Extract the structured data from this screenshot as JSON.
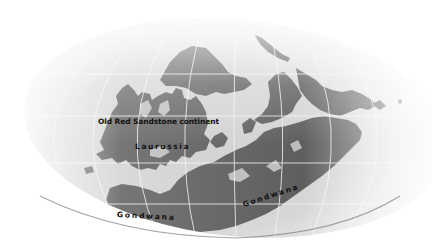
{
  "map": {
    "type": "paleogeographic world map",
    "projection": "elliptical (Mollweide-style), faded globe",
    "colors": {
      "background": "#ffffff",
      "ocean": "#d9d9d9",
      "land": "#5f5f5f",
      "graticule": "#f2f2f2",
      "label_text": "#111111"
    },
    "labels": {
      "old_red_sandstone": "Old Red Sandstone continent",
      "laurussia": "Laurussia",
      "gondwana_west": "Gondwana",
      "gondwana_east": "Gondwana"
    }
  }
}
